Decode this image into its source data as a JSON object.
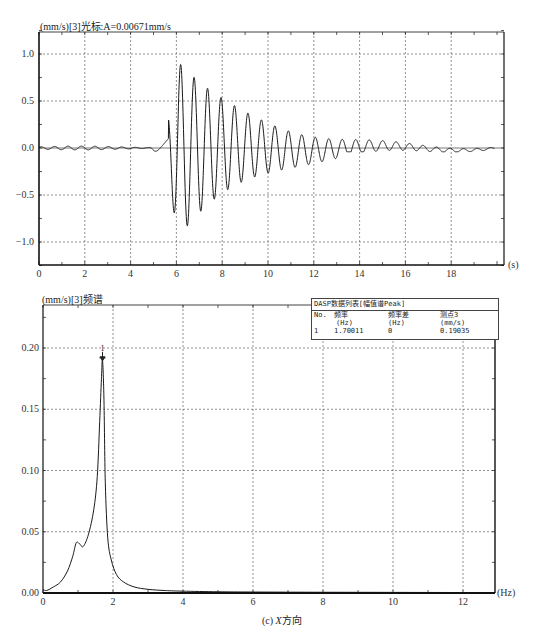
{
  "figure": {
    "caption_prefix": "(c) ",
    "caption_axis": "X",
    "caption_suffix": "方向"
  },
  "chart_data": [
    {
      "type": "line",
      "title": "(mm/s)[3]光标:A=0.00671mm/s",
      "xlabel": "(s)",
      "ylabel": "(mm/s)",
      "xlim": [
        0,
        20
      ],
      "ylim": [
        -1.25,
        1.25
      ],
      "grid": true,
      "x_ticks": [
        "0",
        "2",
        "4",
        "6",
        "8",
        "10",
        "12",
        "14",
        "16",
        "18"
      ],
      "y_ticks": [
        "1.0",
        "0.5",
        "0.0",
        "-0.5",
        "-1.0"
      ],
      "cursor_value": "A=0.00671mm/s",
      "description": "Velocity time history: low-amplitude noise 0-5.2 s, impulse onset ~5.5 s, then decaying oscillation at ~1.7 Hz",
      "peaks": [
        {
          "x": 5.7,
          "y": 0.36
        },
        {
          "x": 6.0,
          "y": -0.8
        },
        {
          "x": 6.3,
          "y": 0.85
        },
        {
          "x": 6.6,
          "y": -0.55
        },
        {
          "x": 6.9,
          "y": 0.51
        },
        {
          "x": 7.2,
          "y": -0.52
        },
        {
          "x": 7.5,
          "y": 0.49
        },
        {
          "x": 7.8,
          "y": -0.41
        },
        {
          "x": 8.0,
          "y": 0.35
        },
        {
          "x": 8.3,
          "y": -0.31
        },
        {
          "x": 8.6,
          "y": 0.32
        },
        {
          "x": 8.9,
          "y": -0.26
        },
        {
          "x": 9.2,
          "y": 0.22
        },
        {
          "x": 9.5,
          "y": -0.2
        },
        {
          "x": 9.8,
          "y": 0.2
        },
        {
          "x": 10.1,
          "y": -0.18
        },
        {
          "x": 10.4,
          "y": 0.17
        },
        {
          "x": 10.7,
          "y": -0.15
        },
        {
          "x": 11.0,
          "y": 0.14
        },
        {
          "x": 11.3,
          "y": -0.12
        },
        {
          "x": 11.6,
          "y": 0.12
        },
        {
          "x": 12.2,
          "y": 0.11
        },
        {
          "x": 12.8,
          "y": 0.09
        },
        {
          "x": 13.4,
          "y": 0.07
        },
        {
          "x": 14.0,
          "y": 0.07
        },
        {
          "x": 14.6,
          "y": 0.06
        },
        {
          "x": 15.2,
          "y": 0.05
        },
        {
          "x": 15.8,
          "y": 0.06
        },
        {
          "x": 16.4,
          "y": 0.04
        },
        {
          "x": 17.0,
          "y": 0.04
        },
        {
          "x": 17.6,
          "y": 0.04
        },
        {
          "x": 18.2,
          "y": 0.03
        },
        {
          "x": 18.8,
          "y": 0.03
        },
        {
          "x": 19.4,
          "y": 0.04
        }
      ],
      "envelope": {
        "onset_s": 5.3,
        "freq_hz": 1.7,
        "amp": 0.9,
        "decay_per_s": 0.32,
        "noise_amp": 0.02
      }
    },
    {
      "type": "line",
      "title": "(mm/s)[3]频谱",
      "xlabel": "(Hz)",
      "ylabel": "(mm/s)",
      "xlim": [
        0,
        12.8
      ],
      "ylim": [
        0,
        0.235
      ],
      "grid": true,
      "x_ticks": [
        "0",
        "2",
        "4",
        "6",
        "8",
        "10",
        "12"
      ],
      "y_ticks": [
        "0.20",
        "0.15",
        "0.10",
        "0.05",
        "0.00"
      ],
      "x": [
        0,
        0.1,
        0.3,
        0.5,
        0.7,
        0.85,
        0.95,
        1.05,
        1.15,
        1.3,
        1.45,
        1.55,
        1.62,
        1.67,
        1.7,
        1.74,
        1.78,
        1.85,
        1.95,
        2.1,
        2.3,
        2.6,
        3.0,
        3.5,
        4.0,
        5.0,
        6.0,
        8.0,
        10.0,
        12.0,
        12.8
      ],
      "y": [
        0.003,
        0.002,
        0.005,
        0.009,
        0.018,
        0.03,
        0.041,
        0.04,
        0.038,
        0.048,
        0.068,
        0.095,
        0.14,
        0.175,
        0.19,
        0.16,
        0.09,
        0.045,
        0.027,
        0.015,
        0.009,
        0.005,
        0.003,
        0.002,
        0.0015,
        0.001,
        0.0008,
        0.0006,
        0.0005,
        0.0004,
        0.0004
      ],
      "annotations": [
        {
          "label": "1",
          "x": 1.70011,
          "y": 0.19035
        }
      ],
      "peak_table": {
        "title": "DASP数据列表[幅值谱Peak]",
        "columns": [
          {
            "header": "No.",
            "unit": ""
          },
          {
            "header": "频率",
            "unit": "(Hz)"
          },
          {
            "header": "频率差",
            "unit": "(Hz)"
          },
          {
            "header": "测点3",
            "unit": "(mm/s)"
          }
        ],
        "rows": [
          [
            "1",
            "1.70011",
            "0",
            "0.19035"
          ]
        ]
      }
    }
  ]
}
